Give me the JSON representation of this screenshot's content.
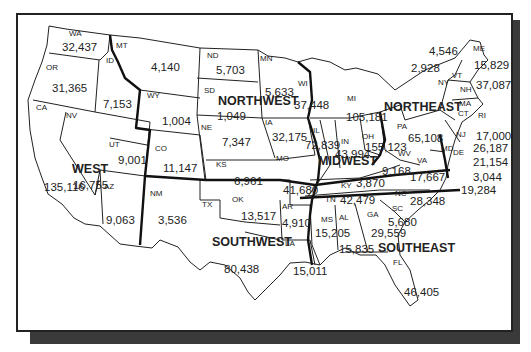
{
  "map": {
    "type": "US regional choropleth-style labeled map",
    "regions": [
      {
        "name": "WEST",
        "x": 72,
        "y": 163
      },
      {
        "name": "NORTHWEST",
        "x": 218,
        "y": 95
      },
      {
        "name": "MIDWEST",
        "x": 318,
        "y": 155
      },
      {
        "name": "NORTHEAST",
        "x": 384,
        "y": 101
      },
      {
        "name": "SOUTHWEST",
        "x": 212,
        "y": 236
      },
      {
        "name": "SOUTHEAST",
        "x": 378,
        "y": 242
      }
    ],
    "states": [
      {
        "abbr": "WA",
        "value": "32,437",
        "ax": 69,
        "ay": 30,
        "vx": 62,
        "vy": 42
      },
      {
        "abbr": "OR",
        "value": "31,365",
        "ax": 46,
        "ay": 64,
        "vx": 52,
        "vy": 83
      },
      {
        "abbr": "CA",
        "value": "135,116",
        "ax": 36,
        "ay": 104,
        "vx": 44,
        "vy": 182
      },
      {
        "abbr": "ID",
        "value": "7,153",
        "ax": 106,
        "ay": 57,
        "vx": 103,
        "vy": 99
      },
      {
        "abbr": "NV",
        "value": "16,755",
        "ax": 66,
        "ay": 112,
        "vx": 73,
        "vy": 180
      },
      {
        "abbr": "MT",
        "value": "4,140",
        "ax": 116,
        "ay": 42,
        "vx": 151,
        "vy": 62
      },
      {
        "abbr": "WY",
        "value": "1,004",
        "ax": 147,
        "ay": 92,
        "vx": 162,
        "vy": 116
      },
      {
        "abbr": "UT",
        "value": "9,001",
        "ax": 109,
        "ay": 141,
        "vx": 118,
        "vy": 155
      },
      {
        "abbr": "AZ",
        "value": "9,063",
        "ax": 104,
        "ay": 183,
        "vx": 106,
        "vy": 215
      },
      {
        "abbr": "CO",
        "value": "11,147",
        "ax": 155,
        "ay": 145,
        "vx": 163,
        "vy": 163
      },
      {
        "abbr": "NM",
        "value": "3,536",
        "ax": 150,
        "ay": 190,
        "vx": 158,
        "vy": 215
      },
      {
        "abbr": "ND",
        "value": "5,703",
        "ax": 207,
        "ay": 52,
        "vx": 216,
        "vy": 65
      },
      {
        "abbr": "SD",
        "value": "1,049",
        "ax": 204,
        "ay": 87,
        "vx": 217,
        "vy": 111
      },
      {
        "abbr": "NE",
        "value": "7,347",
        "ax": 201,
        "ay": 124,
        "vx": 222,
        "vy": 137
      },
      {
        "abbr": "KS",
        "value": "6,961",
        "ax": 216,
        "ay": 161,
        "vx": 234,
        "vy": 176
      },
      {
        "abbr": "MN",
        "value": "5,633",
        "ax": 260,
        "ay": 55,
        "vx": 265,
        "vy": 87
      },
      {
        "abbr": "IA",
        "value": "32,175",
        "ax": 265,
        "ay": 119,
        "vx": 272,
        "vy": 132
      },
      {
        "abbr": "MO",
        "value": "41,680",
        "ax": 276,
        "ay": 155,
        "vx": 283,
        "vy": 185
      },
      {
        "abbr": "WI",
        "value": "37,448",
        "ax": 298,
        "ay": 80,
        "vx": 294,
        "vy": 100
      },
      {
        "abbr": "IL",
        "value": "72,839",
        "ax": 313,
        "ay": 127,
        "vx": 305,
        "vy": 140
      },
      {
        "abbr": "MI",
        "value": "105,181",
        "ax": 347,
        "ay": 95,
        "vx": 346,
        "vy": 112
      },
      {
        "abbr": "IN",
        "value": "43,994",
        "ax": 341,
        "ay": 138,
        "vx": 335,
        "vy": 149
      },
      {
        "abbr": "OH",
        "value": "155,123",
        "ax": 362,
        "ay": 133,
        "vx": 365,
        "vy": 142
      },
      {
        "abbr": "KY",
        "value": "3,870",
        "ax": 341,
        "ay": 182,
        "vx": 356,
        "vy": 178
      },
      {
        "abbr": "TN",
        "value": "42,479",
        "ax": 325,
        "ay": 196,
        "vx": 340,
        "vy": 195
      },
      {
        "abbr": "PA",
        "value": "65,108",
        "ax": 397,
        "ay": 123,
        "vx": 408,
        "vy": 133
      },
      {
        "abbr": "WV",
        "value": "9,168",
        "ax": 398,
        "ay": 150,
        "vx": 382,
        "vy": 166
      },
      {
        "abbr": "VA",
        "value": "17,667",
        "ax": 417,
        "ay": 157,
        "vx": 410,
        "vy": 172
      },
      {
        "abbr": "NC",
        "value": "28,348",
        "ax": 395,
        "ay": 190,
        "vx": 410,
        "vy": 196
      },
      {
        "abbr": "NY",
        "value": "2,928",
        "ax": 438,
        "ay": 79,
        "vx": 411,
        "vy": 63
      },
      {
        "abbr": "VT",
        "value": "4,546",
        "ax": 452,
        "ay": 72,
        "vx": 429,
        "vy": 46
      },
      {
        "abbr": "NH",
        "value": "37,087",
        "ax": 460,
        "ay": 86,
        "vx": 476,
        "vy": 80
      },
      {
        "abbr": "ME",
        "value": "15,829",
        "ax": 473,
        "ay": 45,
        "vx": 474,
        "vy": 60
      },
      {
        "abbr": "MA",
        "value": "",
        "ax": 459,
        "ay": 100,
        "vx": 0,
        "vy": 0
      },
      {
        "abbr": "CT",
        "value": "",
        "ax": 458,
        "ay": 110,
        "vx": 0,
        "vy": 0
      },
      {
        "abbr": "RI",
        "value": "17,000",
        "ax": 478,
        "ay": 112,
        "vx": 476,
        "vy": 131
      },
      {
        "abbr": "NJ",
        "value": "26,187",
        "ax": 456,
        "ay": 131,
        "vx": 473,
        "vy": 143
      },
      {
        "abbr": "DE",
        "value": "21,154",
        "ax": 453,
        "ay": 149,
        "vx": 473,
        "vy": 157
      },
      {
        "abbr": "MD",
        "value": "3,044",
        "ax": 441,
        "ay": 145,
        "vx": 473,
        "vy": 172
      },
      {
        "abbr": "",
        "value": "19,284",
        "ax": 0,
        "ay": 0,
        "vx": 461,
        "vy": 185
      },
      {
        "abbr": "OK",
        "value": "13,517",
        "ax": 232,
        "ay": 196,
        "vx": 241,
        "vy": 211
      },
      {
        "abbr": "TX",
        "value": "80,438",
        "ax": 202,
        "ay": 201,
        "vx": 224,
        "vy": 264
      },
      {
        "abbr": "AR",
        "value": "4,910",
        "ax": 282,
        "ay": 203,
        "vx": 282,
        "vy": 218
      },
      {
        "abbr": "LA",
        "value": "15,011",
        "ax": 285,
        "ay": 240,
        "vx": 293,
        "vy": 266
      },
      {
        "abbr": "MS",
        "value": "15,205",
        "ax": 321,
        "ay": 216,
        "vx": 315,
        "vy": 228
      },
      {
        "abbr": "AL",
        "value": "15,835",
        "ax": 339,
        "ay": 214,
        "vx": 339,
        "vy": 244
      },
      {
        "abbr": "GA",
        "value": "29,559",
        "ax": 367,
        "ay": 211,
        "vx": 371,
        "vy": 228
      },
      {
        "abbr": "SC",
        "value": "5,680",
        "ax": 392,
        "ay": 205,
        "vx": 388,
        "vy": 217
      },
      {
        "abbr": "FL",
        "value": "46,405",
        "ax": 393,
        "ay": 259,
        "vx": 404,
        "vy": 287
      }
    ]
  }
}
